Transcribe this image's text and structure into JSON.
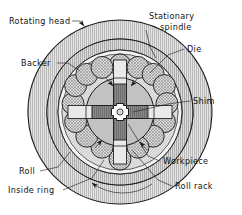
{
  "figure": {
    "type": "technical-cross-section-diagram",
    "labels": {
      "rotating_head": "Rotating head",
      "stationary_spindle_line1": "Stationary",
      "stationary_spindle_line2": "spindle",
      "die": "Die",
      "backer": "Backer",
      "shim": "Shim",
      "roll": "Roll",
      "inside_ring": "Inside ring",
      "workpiece": "Workpiece",
      "roll_rack": "Roll rack"
    },
    "colors": {
      "outline": "#1a1a1a",
      "rotating_head_fill": "#d8d8d8",
      "roll_rack_fill": "#c9c9c9",
      "inside_ring_fill": "#efefef",
      "spindle_fill": "#c0c0c0",
      "roller_fill": "#cfcfcf",
      "die_fill": "#7d7d7d",
      "shim_fill": "#e9e9e9",
      "backer_fill": "#b5b5b5",
      "workpiece_fill": "#ffffff",
      "label_text": "#111111"
    },
    "geometry": {
      "center_x": 120,
      "center_y": 112,
      "rotating_head_outer_radius": 92,
      "rotating_head_inner_radius": 73,
      "roll_rack_outer_radius": 73,
      "roll_rack_inner_radius": 62,
      "inside_ring_radius": 58,
      "roller_orbit_radius": 47,
      "roller_radius": 11,
      "roller_count": 16,
      "spindle_radius": 34,
      "die_arm_count": 4,
      "workpiece_radius": 7
    },
    "rotation": {
      "direction": "counterclockwise",
      "arrow_position": "bottom"
    }
  }
}
